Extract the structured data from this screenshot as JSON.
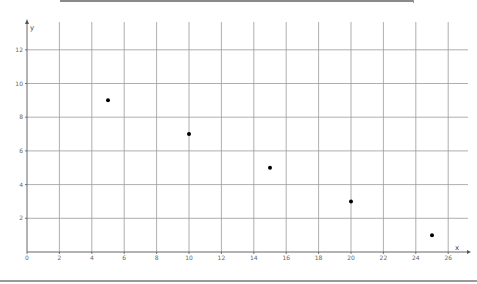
{
  "chart_data": {
    "type": "scatter",
    "title": "",
    "xlabel": "x",
    "ylabel": "y",
    "xlim": [
      0,
      27
    ],
    "ylim": [
      0,
      13
    ],
    "grid": true,
    "x_ticks": [
      0,
      2,
      4,
      6,
      8,
      10,
      12,
      14,
      16,
      18,
      20,
      22,
      24,
      26
    ],
    "y_ticks": [
      2,
      4,
      6,
      8,
      10,
      12
    ],
    "x_tick_labels": [
      "0",
      "2",
      "4",
      "6",
      "8",
      "10",
      "12",
      "14",
      "16",
      "18",
      "20",
      "22",
      "24",
      "26"
    ],
    "y_tick_labels": [
      "2",
      "4",
      "6",
      "8",
      "10",
      "12"
    ],
    "series": [
      {
        "name": "points",
        "x": [
          5,
          10,
          15,
          20,
          25
        ],
        "y": [
          9,
          7,
          5,
          3,
          1
        ]
      }
    ],
    "colors": {
      "grid": "#9a9a9a",
      "axis": "#555555",
      "point": "#000000"
    }
  }
}
